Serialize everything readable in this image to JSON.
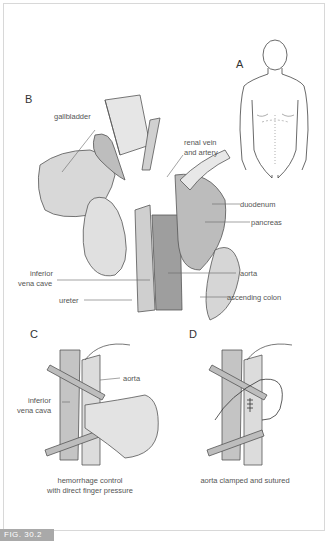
{
  "figure": {
    "id_label": "FIG. 30.2",
    "panels": {
      "A": {
        "letter": "A"
      },
      "B": {
        "letter": "B",
        "labels": {
          "gallbladder": "gallbladder",
          "renal_1": "renal vein",
          "renal_2": "and artery",
          "duodenum": "duodenum",
          "pancreas": "pancreas",
          "ivc_1": "inferior",
          "ivc_2": "vena cave",
          "aorta": "aorta",
          "ureter": "ureter",
          "ascending_colon": "ascending colon"
        }
      },
      "C": {
        "letter": "C",
        "labels": {
          "aorta": "aorta",
          "ivc_1": "inferior",
          "ivc_2": "vena cava"
        },
        "caption_1": "hemorrhage control",
        "caption_2": "with direct finger pressure"
      },
      "D": {
        "letter": "D",
        "caption": "aorta clamped and sutured"
      }
    }
  }
}
